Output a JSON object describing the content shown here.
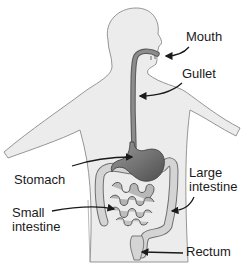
{
  "diagram": {
    "colors": {
      "background": "#ffffff",
      "body_fill": "#ececec",
      "body_outline": "#8a8a8a",
      "organ_fill": "#8c8c8c",
      "organ_dark": "#5e5e5e",
      "intestine_fill": "#cfcfcf",
      "intestine_outline": "#6f6f6f",
      "arrow": "#1a1a1a",
      "text": "#1a1a1a"
    },
    "labels": {
      "mouth": "Mouth",
      "gullet": "Gullet",
      "stomach": "Stomach",
      "large_intestine_line1": "Large",
      "large_intestine_line2": "intestine",
      "small_intestine_line1": "Small",
      "small_intestine_line2": "intestine",
      "rectum": "Rectum"
    }
  }
}
